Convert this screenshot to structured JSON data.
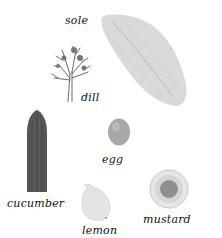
{
  "scene": {
    "description": "Illustrated ingredients for a recipe, each with an italic label",
    "items": [
      {
        "id": "sole",
        "label": "sole"
      },
      {
        "id": "dill",
        "label": "dill"
      },
      {
        "id": "egg",
        "label": "egg"
      },
      {
        "id": "cucumber",
        "label": "cucumber"
      },
      {
        "id": "lemon",
        "label": "lemon"
      },
      {
        "id": "mustard",
        "label": "mustard"
      }
    ]
  },
  "colors": {
    "background": "#ffffff",
    "label": "#111111",
    "sole": "#d9d9d9",
    "dill": "#6b6b6b",
    "cucumber": "#555555",
    "egg": "#a8a8a8",
    "lemon": "#e4e4e4",
    "mustard_dish": "#e0e0e0",
    "mustard": "#8f8f8f"
  }
}
